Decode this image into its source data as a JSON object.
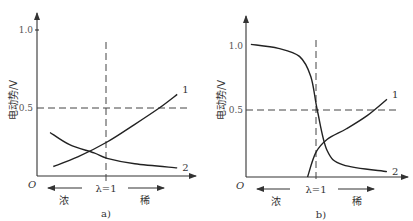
{
  "chart_data": [
    {
      "panel": "a)",
      "type": "line",
      "ylabel": "电动势/V",
      "xlabel": "",
      "origin_label": "O",
      "yticks": [
        "0.5",
        "1.0"
      ],
      "ylim": [
        0,
        1.1
      ],
      "xlim": [
        0,
        1
      ],
      "reference_lines": {
        "horizontal_y": 0.5,
        "vertical_label": "λ=1",
        "vertical_x": 0.43
      },
      "direction_labels": {
        "left": "浓",
        "right": "稀"
      },
      "series": [
        {
          "name": "1",
          "points": [
            [
              0.1,
              0.07
            ],
            [
              0.25,
              0.14
            ],
            [
              0.43,
              0.25
            ],
            [
              0.6,
              0.38
            ],
            [
              0.75,
              0.5
            ],
            [
              0.86,
              0.6
            ]
          ]
        },
        {
          "name": "2",
          "points": [
            [
              0.08,
              0.32
            ],
            [
              0.2,
              0.23
            ],
            [
              0.35,
              0.17
            ],
            [
              0.43,
              0.13
            ],
            [
              0.6,
              0.09
            ],
            [
              0.86,
              0.06
            ]
          ]
        }
      ]
    },
    {
      "panel": "b)",
      "type": "line",
      "ylabel": "电动势/V",
      "xlabel": "",
      "origin_label": "O",
      "yticks": [
        "0.5",
        "1.0"
      ],
      "ylim": [
        0,
        1.1
      ],
      "xlim": [
        0,
        1
      ],
      "reference_lines": {
        "horizontal_y": 0.5,
        "vertical_label": "λ=1",
        "vertical_x": 0.45
      },
      "direction_labels": {
        "left": "浓",
        "right": "稀"
      },
      "series": [
        {
          "name": "1",
          "points": [
            [
              0.38,
              0.0
            ],
            [
              0.43,
              0.18
            ],
            [
              0.5,
              0.28
            ],
            [
              0.62,
              0.36
            ],
            [
              0.75,
              0.46
            ],
            [
              0.87,
              0.58
            ]
          ]
        },
        {
          "name": "2",
          "points": [
            [
              0.03,
              0.99
            ],
            [
              0.2,
              0.96
            ],
            [
              0.33,
              0.9
            ],
            [
              0.4,
              0.75
            ],
            [
              0.44,
              0.5
            ],
            [
              0.5,
              0.2
            ],
            [
              0.6,
              0.09
            ],
            [
              0.87,
              0.04
            ]
          ]
        }
      ]
    }
  ]
}
